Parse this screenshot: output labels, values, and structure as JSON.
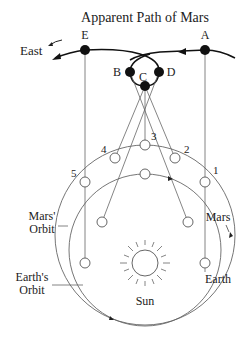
{
  "title": "Apparent Path of Mars",
  "direction_label": "East",
  "apparent_points": [
    "A",
    "B",
    "C",
    "D",
    "E"
  ],
  "mars_positions": [
    "1",
    "2",
    "3",
    "4",
    "5"
  ],
  "labels": {
    "mars_orbit_line1": "Mars'",
    "mars_orbit_line2": "Orbit",
    "earth_orbit_line1": "Earth's",
    "earth_orbit_line2": "Orbit",
    "mars": "Mars",
    "earth": "Earth",
    "sun": "Sun"
  },
  "caption_partial": "Apparent path of Mars as seen from Earth (cut off)",
  "colors": {
    "line": "#555555",
    "ink": "#111111",
    "background": "#ffffff"
  }
}
